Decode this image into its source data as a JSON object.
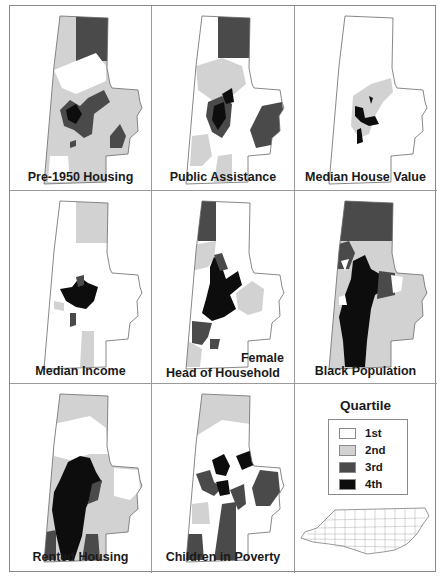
{
  "figure": {
    "legend": {
      "title": "Quartile",
      "items": [
        {
          "label": "1st",
          "color": "#ffffff"
        },
        {
          "label": "2nd",
          "color": "#d2d2d2"
        },
        {
          "label": "3rd",
          "color": "#4a4a4a"
        },
        {
          "label": "4th",
          "color": "#0d0d0d"
        }
      ],
      "inset_map": "North Carolina counties outline"
    },
    "panels": [
      {
        "id": "pre1950",
        "label": "Pre-1950 Housing"
      },
      {
        "id": "public_assistance",
        "label": "Public Assistance"
      },
      {
        "id": "median_house_value",
        "label": "Median House Value"
      },
      {
        "id": "median_income",
        "label": "Median Income"
      },
      {
        "id": "female_hoh",
        "label_line1": "Female",
        "label_line2": "Head of Household"
      },
      {
        "id": "black_population",
        "label": "Black Population"
      },
      {
        "id": "rented_housing",
        "label": "Rented Housing"
      },
      {
        "id": "children_poverty",
        "label": "Children in Poverty"
      }
    ]
  },
  "colors": {
    "q1": "#ffffff",
    "q2": "#d2d2d2",
    "q3": "#4a4a4a",
    "q4": "#0d0d0d",
    "outline": "#6a6a6a",
    "grid": "#8a8a8a"
  }
}
